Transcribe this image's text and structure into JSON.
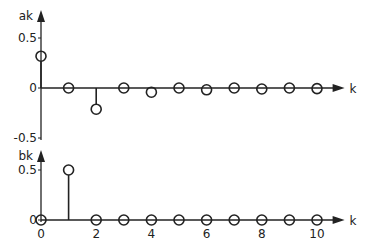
{
  "chart_data": [
    {
      "type": "stem",
      "title": "",
      "ylabel": "a_k",
      "xlabel": "k",
      "ylabel_text": "ak",
      "xlabel_text": "k",
      "x": [
        0,
        1,
        2,
        3,
        4,
        5,
        6,
        7,
        8,
        9,
        10
      ],
      "values": [
        0.318,
        0,
        -0.212,
        0,
        -0.042,
        0,
        -0.018,
        0,
        -0.01,
        0,
        -0.006
      ],
      "yticks": [
        "0.5",
        "0",
        "-0.5"
      ],
      "ylim": [
        -0.5,
        0.5
      ],
      "xlim": [
        0,
        11
      ]
    },
    {
      "type": "stem",
      "title": "",
      "ylabel": "b_k",
      "xlabel": "k",
      "ylabel_text": "bk",
      "xlabel_text": "k",
      "x": [
        0,
        1,
        2,
        3,
        4,
        5,
        6,
        7,
        8,
        9,
        10
      ],
      "values": [
        0,
        0.5,
        0,
        0,
        0,
        0,
        0,
        0,
        0,
        0,
        0
      ],
      "yticks": [
        "0.5",
        "0"
      ],
      "xticks": [
        "0",
        "2",
        "4",
        "6",
        "8",
        "10"
      ],
      "ylim": [
        0,
        0.5
      ],
      "xlim": [
        0,
        11
      ]
    }
  ]
}
